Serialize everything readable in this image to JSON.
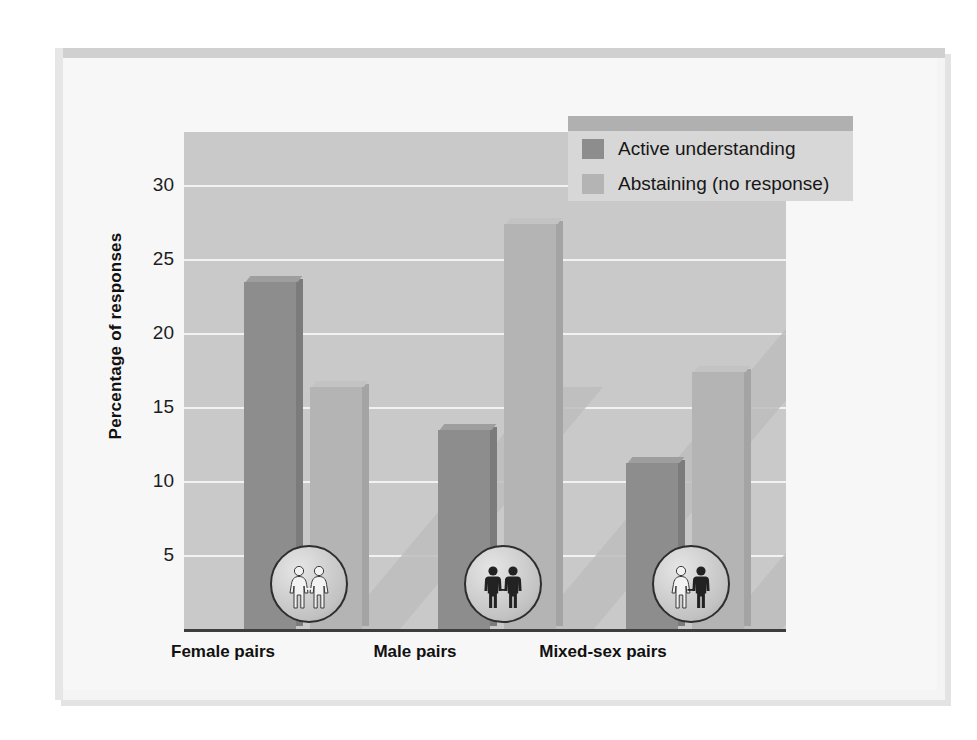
{
  "chart_data": {
    "type": "bar",
    "title": "",
    "xlabel": "",
    "ylabel": "Percentage of responses",
    "categories": [
      "Female pairs",
      "Male pairs",
      "Mixed-sex pairs"
    ],
    "series": [
      {
        "name": "Active understanding",
        "color": "#8d8d8d",
        "values": [
          23.4,
          13.4,
          11.2
        ]
      },
      {
        "name": "Abstaining (no response)",
        "color": "#b4b4b4",
        "values": [
          16.3,
          27.3,
          17.3
        ]
      }
    ],
    "ylim": [
      0,
      33.5
    ],
    "yticks": [
      30,
      25,
      20,
      15,
      10,
      5
    ],
    "ytick_labels": [
      "30",
      "25",
      "20",
      "15",
      "10",
      "5"
    ],
    "grid": true,
    "legend_position": "top-right",
    "plot_background": "#c9c9c9",
    "gridline_color": "#f2f2f2",
    "axis_color": "#3d3d3d"
  },
  "legend": {
    "items": [
      {
        "label": "Active understanding",
        "swatch": "dark"
      },
      {
        "label": "Abstaining (no response)",
        "swatch": "light"
      }
    ]
  },
  "axis": {
    "ylabel": "Percentage of responses",
    "ticks": [
      "30",
      "25",
      "20",
      "15",
      "10",
      "5"
    ]
  },
  "groups": [
    {
      "label": "Female pairs",
      "icon": "female-female-pair-icon"
    },
    {
      "label": "Male pairs",
      "icon": "male-male-pair-icon"
    },
    {
      "label": "Mixed-sex pairs",
      "icon": "female-male-pair-icon"
    }
  ]
}
